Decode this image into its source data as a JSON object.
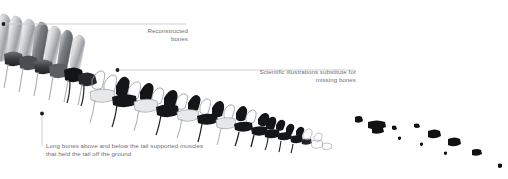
{
  "figure": {
    "background_color": "#ffffff",
    "leader_line_color": "#c9cacc",
    "text_color": "#6f7072",
    "bone_dark_color": "#17181a",
    "bone_mid_color": "#8d9095",
    "bone_light_color": "#e9eaec",
    "bone_outline_color": "#9a9da2"
  },
  "annotations": [
    {
      "id": "reconstructed",
      "text": "Reconstructed\nbones",
      "align": "right",
      "leader": {
        "type": "horizontal",
        "dot_x": 3,
        "dot_y": 24,
        "end_x": 186,
        "end_y": 24
      }
    },
    {
      "id": "substitute",
      "text": "Scientific illustrations substitute for\nmissing bones",
      "align": "right",
      "leader": {
        "type": "horizontal",
        "dot_x": 117,
        "dot_y": 70,
        "end_x": 356,
        "end_y": 70
      }
    },
    {
      "id": "longbones",
      "text": "Long bones above and below the tail supported muscles\nthat held the tail off the ground",
      "align": "left",
      "leader": {
        "type": "vertical",
        "dot_x": 42,
        "dot_y": 113,
        "end_x": 42,
        "end_y": 146
      }
    }
  ],
  "skeleton": {
    "description": "Sauropod tail skeleton in lateral view descending left-to-right, tapering to scattered distal fragments",
    "vertebrae_count": 34,
    "fragment_count": 9,
    "segments": [
      {
        "name": "proximal-tall-spines",
        "style": "photographic-grey",
        "x_range": [
          0,
          86
        ]
      },
      {
        "name": "mid-alternating",
        "style": "mixed-dark-and-outline",
        "x_range": [
          86,
          250
        ]
      },
      {
        "name": "distal-dark",
        "style": "dark-silhouette",
        "x_range": [
          250,
          355
        ]
      },
      {
        "name": "scattered-fragments",
        "style": "dark-fragments",
        "x_range": [
          355,
          500
        ]
      }
    ]
  }
}
